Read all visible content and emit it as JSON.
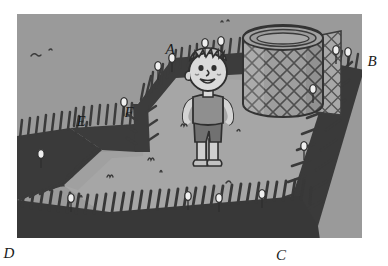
{
  "figure": {
    "frame": {
      "x": 17,
      "y": 14,
      "width": 345,
      "height": 224,
      "background_color": "#9a9a9a",
      "border_color": "#c8c8c8"
    },
    "colors": {
      "page_background": "#ffffff",
      "lawn": "#9d9d9d",
      "lawn_inner": "#a7a7a7",
      "hedge_dark": "#3a3a3a",
      "hedge_shadow": "#2c2c2c",
      "mesh_line": "#4a4a4a",
      "mesh_fill": "#9e9e9e",
      "mesh_fill_light": "#b4b4b4",
      "skin": "#d9d9d9",
      "shirt": "#8e8e8e",
      "shorts": "#6f6f6f",
      "hair": "#bdbdbd",
      "outline": "#2b2b2b",
      "flower": "#f0f0f0",
      "label_text": "#1a1a1a"
    },
    "labels": [
      {
        "id": "A",
        "text": "A",
        "x": 174,
        "y": 48,
        "desc": "vertex-a-top-hedge-corner"
      },
      {
        "id": "B",
        "text": "B",
        "x": 370,
        "y": 62,
        "desc": "vertex-b-right-outside"
      },
      {
        "id": "C",
        "text": "C",
        "x": 281,
        "y": 258,
        "desc": "vertex-c-bottom"
      },
      {
        "id": "D",
        "text": "D",
        "x": 8,
        "y": 256,
        "desc": "vertex-d-bottom-left"
      },
      {
        "id": "E",
        "text": "E",
        "x": 80,
        "y": 122,
        "desc": "vertex-e-notch-left"
      },
      {
        "id": "F",
        "text": "F",
        "x": 128,
        "y": 113,
        "desc": "vertex-f-notch-right"
      }
    ],
    "objects": {
      "boy": {
        "name": "boy-character",
        "description": "cartoon boy standing on lawn with spiky hair, t-shirt, shorts and shoes",
        "x": 207,
        "y": 115
      },
      "mesh_roll": {
        "name": "wire-mesh-cylinder",
        "description": "cylindrical roll of diamond-pattern wire mesh fencing with an unrolled flap",
        "x": 283,
        "y": 70
      },
      "hedge": {
        "name": "hedge-border",
        "description": "dark spiky grass hedge bordering the lawn with small white flower buds"
      }
    },
    "flowers": [
      {
        "x": 158,
        "y": 72
      },
      {
        "x": 172,
        "y": 63
      },
      {
        "x": 205,
        "y": 48
      },
      {
        "x": 220,
        "y": 44
      },
      {
        "x": 124,
        "y": 104
      },
      {
        "x": 118,
        "y": 116
      },
      {
        "x": 41,
        "y": 155
      },
      {
        "x": 70,
        "y": 200
      },
      {
        "x": 188,
        "y": 198
      },
      {
        "x": 220,
        "y": 201
      },
      {
        "x": 262,
        "y": 196
      },
      {
        "x": 304,
        "y": 149
      },
      {
        "x": 336,
        "y": 51
      },
      {
        "x": 348,
        "y": 54
      },
      {
        "x": 313,
        "y": 92
      }
    ]
  }
}
